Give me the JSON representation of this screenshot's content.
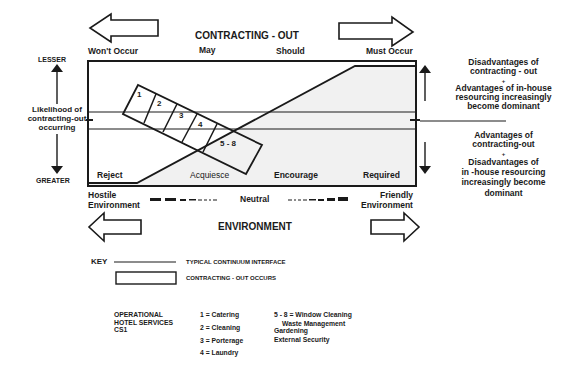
{
  "top_axis": {
    "title": "CONTRACTING - OUT",
    "columns": [
      "Won't Occur",
      "May",
      "Should",
      "Must Occur"
    ]
  },
  "left_axis": {
    "top_label": "LESSER",
    "bottom_label": "GREATER",
    "title_lines": [
      "Likelihood of",
      "contracting-out",
      "occurring"
    ]
  },
  "zones": [
    "Reject",
    "Acquiesce",
    "Encourage",
    "Required"
  ],
  "segments": [
    "1",
    "2",
    "3",
    "4",
    "5 - 8"
  ],
  "right_notes": {
    "upper": [
      "Disadvantages of",
      "contracting - out",
      "+",
      "Advantages of in-house",
      "resourcing  increasingly",
      "become dominant"
    ],
    "lower": [
      "Advantages of",
      "contracting-out",
      "+",
      "Disadvantages of",
      "in -house resourcing",
      "increasingly become",
      "dominant"
    ]
  },
  "environment": {
    "left_label": [
      "Hostile",
      "Environment"
    ],
    "center_label": "Neutral",
    "right_label": [
      "Friendly",
      "Environment"
    ],
    "title": "ENVIRONMENT"
  },
  "key": {
    "label": "KEY",
    "items": [
      {
        "symbol": "line",
        "text": "TYPICAL CONTINUUM INTERFACE"
      },
      {
        "symbol": "rectangle",
        "text": "CONTRACTING - OUT OCCURS"
      }
    ]
  },
  "services": {
    "title_lines": [
      "OPERATIONAL",
      "HOTEL SERVICES",
      "CS1"
    ],
    "list_a": [
      "1 = Catering",
      "2 = Cleaning",
      "3 = Porterage",
      "4 = Laundry"
    ],
    "list_b": [
      "5 - 8 = Window Cleaning",
      "Waste Management",
      "Gardening",
      "External Security"
    ]
  },
  "colors": {
    "ink": "#1a1a1a",
    "shade": "#f1f1f1",
    "background": "#ffffff"
  }
}
